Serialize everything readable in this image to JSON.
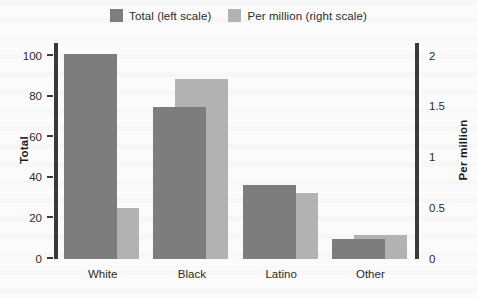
{
  "chart_data": {
    "type": "bar",
    "title": "",
    "subtitle": "",
    "categories": [
      "White",
      "Black",
      "Latino",
      "Other"
    ],
    "series": [
      {
        "name": "Total (left scale)",
        "axis": "left",
        "color": "#7d7d7d",
        "values": [
          101,
          75,
          36.5,
          10
        ]
      },
      {
        "name": "Per million (right scale)",
        "axis": "right",
        "color": "#b2b2b2",
        "values": [
          0.5,
          1.77,
          0.65,
          0.24
        ]
      }
    ],
    "xlabel": "",
    "ylabel": "Total",
    "y2label": "Per million",
    "ylim": [
      0,
      105
    ],
    "y2lim": [
      0,
      2.1
    ],
    "yticks": [
      0,
      20,
      40,
      60,
      80,
      100
    ],
    "yticklabels": [
      "0",
      "20",
      "40",
      "60",
      "80",
      "100"
    ],
    "y2ticks": [
      0,
      0.5,
      1,
      1.5,
      2
    ],
    "y2ticklabels": [
      "0",
      "0.5",
      "1",
      "1.5",
      "2"
    ],
    "grid": false,
    "legend_position": "top-center"
  },
  "legend": {
    "entries": [
      {
        "label": "Total (left scale)",
        "color": "#7d7d7d"
      },
      {
        "label": "Per million (right scale)",
        "color": "#b2b2b2"
      }
    ]
  },
  "axes": {
    "left_title": "Total",
    "right_title": "Per million"
  },
  "colors": {
    "background": "#fbfbfb",
    "axis": "#3a3a3a",
    "text": "#2b2b2b",
    "series_total": "#7d7d7d",
    "series_per_million": "#b2b2b2"
  }
}
